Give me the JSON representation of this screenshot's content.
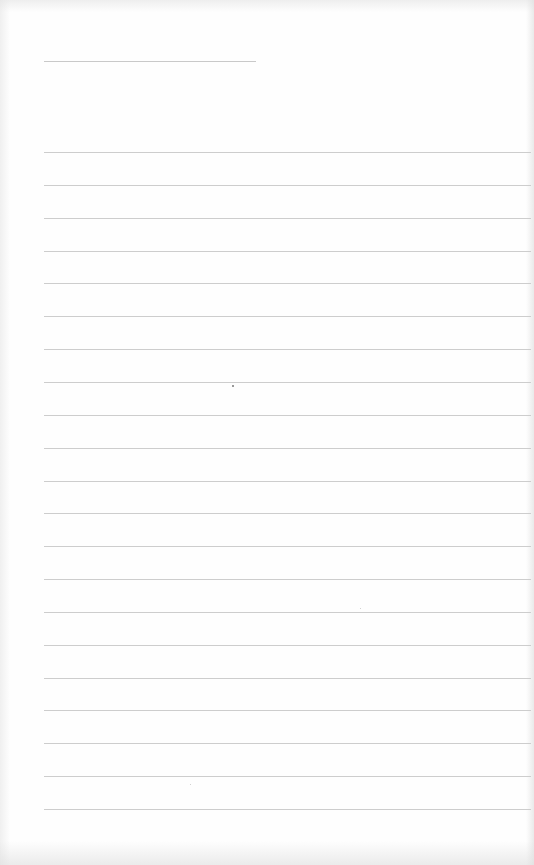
{
  "document": {
    "type": "lined-paper",
    "background_color": "#fefefe",
    "line_color": "#cdcdcd",
    "title_line": {
      "x": 44,
      "y": 61,
      "width": 212,
      "text": ""
    },
    "ruled_lines": {
      "count": 21,
      "first_y": 152,
      "last_y": 809,
      "spacing": 32.85,
      "x_start": 44,
      "x_end": 531,
      "entries": [
        "",
        "",
        "",
        "",
        "",
        "",
        "",
        "",
        "",
        "",
        "",
        "",
        "",
        "",
        "",
        "",
        "",
        "",
        "",
        "",
        ""
      ]
    },
    "marks": [
      {
        "x": 232,
        "y": 385,
        "kind": "speck"
      },
      {
        "x": 360,
        "y": 608,
        "kind": "faint"
      },
      {
        "x": 190,
        "y": 784,
        "kind": "faint"
      }
    ]
  }
}
